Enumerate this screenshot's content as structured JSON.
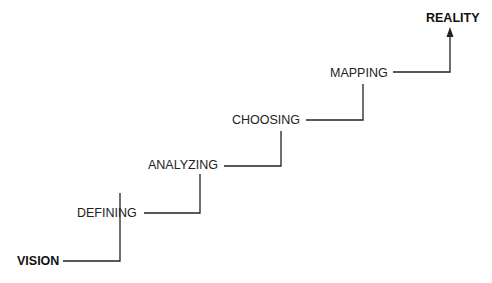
{
  "diagram": {
    "type": "staircase-flow",
    "steps": [
      {
        "label": "VISION",
        "emphasis": "bold"
      },
      {
        "label": "DEFINING",
        "emphasis": "normal"
      },
      {
        "label": "ANALYZING",
        "emphasis": "normal"
      },
      {
        "label": "CHOOSING",
        "emphasis": "normal"
      },
      {
        "label": "MAPPING",
        "emphasis": "normal"
      },
      {
        "label": "REALITY",
        "emphasis": "bold"
      }
    ],
    "line_color": "#222222"
  }
}
